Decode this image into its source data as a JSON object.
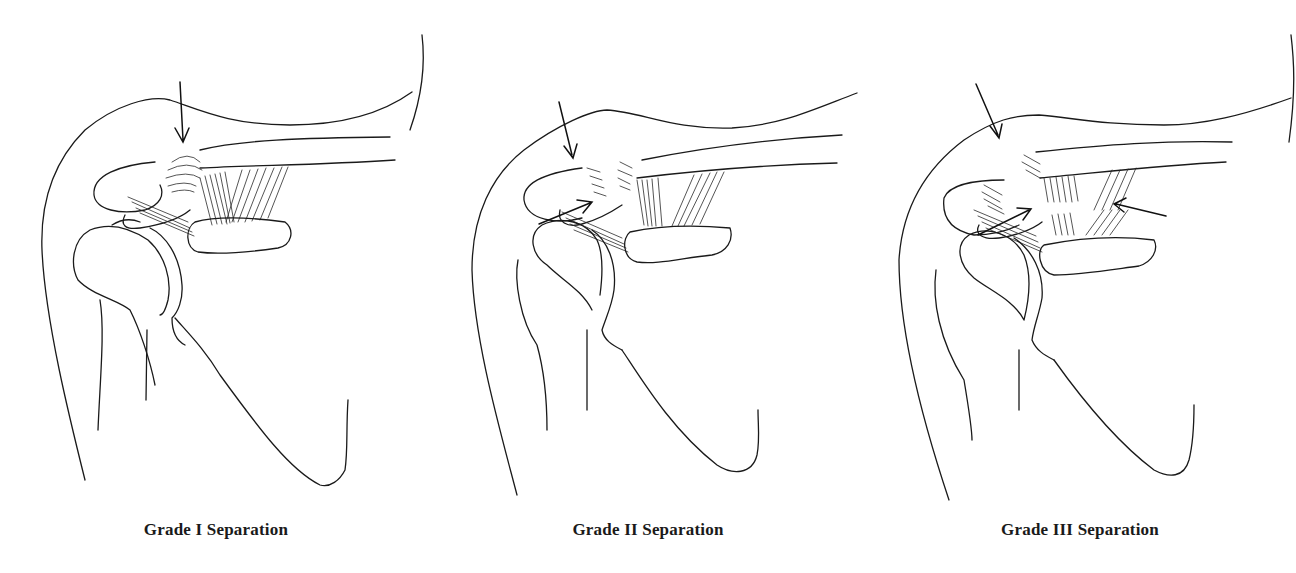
{
  "figure": {
    "panels": [
      {
        "id": "grade-1",
        "caption": "Grade I Separation",
        "arrow_count": 1
      },
      {
        "id": "grade-2",
        "caption": "Grade II Separation",
        "arrow_count": 2
      },
      {
        "id": "grade-3",
        "caption": "Grade III Separation",
        "arrow_count": 3
      }
    ],
    "colors": {
      "line": "#1a1a1a",
      "background": "#ffffff"
    }
  }
}
